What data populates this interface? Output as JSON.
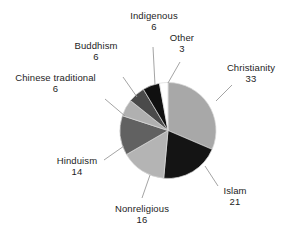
{
  "chart_data": {
    "type": "pie",
    "title": "",
    "subtitle": "",
    "xlabel": "",
    "ylabel": "",
    "legend_position": "none",
    "grid": false,
    "value_unit": "percent",
    "start_angle_deg": 0,
    "direction": "clockwise",
    "categories": [
      "Christianity",
      "Islam",
      "Nonreligious",
      "Hinduism",
      "Chinese traditional",
      "Buddhism",
      "Indigenous",
      "Other"
    ],
    "values": [
      33,
      21,
      16,
      14,
      6,
      6,
      6,
      3
    ],
    "colors": [
      "#a8a8a8",
      "#141414",
      "#b4b4b4",
      "#616161",
      "#b0b0b0",
      "#4a4a4a",
      "#101010",
      "#ffffff"
    ],
    "slices": [
      {
        "label": "Christianity",
        "value": 33,
        "value_text": "33",
        "color": "#a8a8a8"
      },
      {
        "label": "Islam",
        "value": 21,
        "value_text": "21",
        "color": "#141414"
      },
      {
        "label": "Nonreligious",
        "value": 16,
        "value_text": "16",
        "color": "#b4b4b4"
      },
      {
        "label": "Hinduism",
        "value": 14,
        "value_text": "14",
        "color": "#616161"
      },
      {
        "label": "Chinese traditional",
        "value": 6,
        "value_text": "6",
        "color": "#b0b0b0"
      },
      {
        "label": "Buddhism",
        "value": 6,
        "value_text": "6",
        "color": "#4a4a4a"
      },
      {
        "label": "Indigenous",
        "value": 6,
        "value_text": "6",
        "color": "#101010"
      },
      {
        "label": "Other",
        "value": 3,
        "value_text": "3",
        "color": "#ffffff"
      }
    ]
  },
  "labels": {
    "christianity": {
      "name": "Christianity",
      "value": "33"
    },
    "islam": {
      "name": "Islam",
      "value": "21"
    },
    "nonreligious": {
      "name": "Nonreligious",
      "value": "16"
    },
    "hinduism": {
      "name": "Hinduism",
      "value": "14"
    },
    "chinese_traditional": {
      "name": "Chinese traditional",
      "value": "6"
    },
    "buddhism": {
      "name": "Buddhism",
      "value": "6"
    },
    "indigenous": {
      "name": "Indigenous",
      "value": "6"
    },
    "other": {
      "name": "Other",
      "value": "3"
    }
  }
}
